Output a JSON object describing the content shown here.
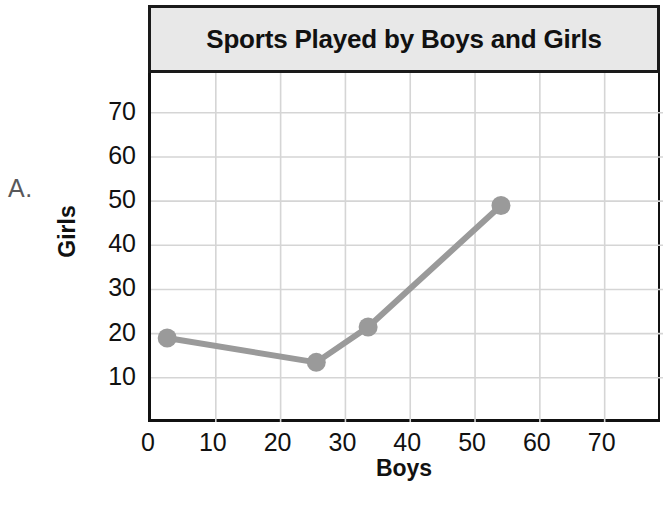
{
  "choice": {
    "label": "A."
  },
  "chart_data": {
    "type": "line",
    "title": "Sports Played by Boys and Girls",
    "xlabel": "Boys",
    "ylabel": "Girls",
    "xlim": [
      0,
      79
    ],
    "ylim": [
      0,
      79
    ],
    "xticks": [
      0,
      10,
      20,
      30,
      40,
      50,
      60,
      70
    ],
    "xtick_labels": [
      "0",
      "10",
      "20",
      "30",
      "40",
      "50",
      "60",
      "70"
    ],
    "yticks": [
      10,
      20,
      30,
      40,
      50,
      60,
      70
    ],
    "ytick_labels": [
      "10",
      "20",
      "30",
      "40",
      "50",
      "60",
      "70"
    ],
    "grid": true,
    "legend": "none",
    "series": [
      {
        "name": "Sports played",
        "marker": "circle",
        "x": [
          2.5,
          25.5,
          33.5,
          54
        ],
        "y": [
          19,
          13.5,
          21.5,
          49
        ],
        "points": [
          {
            "x": 2.5,
            "y": 19
          },
          {
            "x": 25.5,
            "y": 13.5
          },
          {
            "x": 33.5,
            "y": 21.5
          },
          {
            "x": 54,
            "y": 49
          }
        ]
      }
    ]
  },
  "style": {
    "line_color": "#9a9a9a",
    "marker_color": "#9a9a9a",
    "grid_color": "#d5d5d5",
    "axis_color": "#111111",
    "title_bg": "#e8e8e8",
    "title_border": "#1a1a1a",
    "text_color": "#111111",
    "choice_color": "#58585a"
  }
}
